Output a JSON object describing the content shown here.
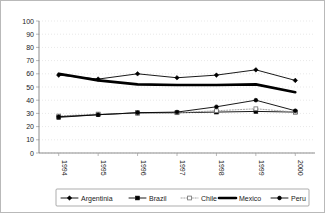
{
  "chart_data": {
    "type": "line",
    "title": "",
    "subtitle": "",
    "xlabel": "",
    "ylabel": "",
    "categories": [
      "1994",
      "1995",
      "1996",
      "1997",
      "1998",
      "1999",
      "2000"
    ],
    "ylim": [
      0,
      100
    ],
    "yticks": [
      0,
      10,
      20,
      30,
      40,
      50,
      60,
      70,
      80,
      90,
      100
    ],
    "grid": true,
    "legend_position": "bottom",
    "series": [
      {
        "name": "Argentinia",
        "values": [
          59,
          56,
          60,
          57,
          59,
          63,
          55
        ],
        "color": "#000000",
        "marker": "diamond",
        "line_style": "solid",
        "line_width": 0.9
      },
      {
        "name": "Brazil",
        "values": [
          27,
          29,
          30.5,
          30.5,
          31,
          31.5,
          31
        ],
        "color": "#000000",
        "marker": "square",
        "line_style": "solid",
        "line_width": 0.9
      },
      {
        "name": "Chile",
        "values": [
          28,
          29.5,
          30,
          30.5,
          32,
          33.5,
          31
        ],
        "color": "#9a9a9a",
        "marker": "open-square",
        "line_style": "dotted",
        "line_width": 0.9
      },
      {
        "name": "Mexico",
        "values": [
          60,
          55,
          52,
          51.5,
          51.5,
          52,
          46
        ],
        "color": "#000000",
        "marker": "none",
        "line_style": "solid",
        "line_width": 2.6
      },
      {
        "name": "Peru",
        "values": [
          27.5,
          29,
          30.5,
          31,
          35,
          40,
          32
        ],
        "color": "#000000",
        "marker": "circle",
        "line_style": "solid",
        "line_width": 0.9
      }
    ]
  },
  "axes": {
    "ytick_labels": [
      "100",
      "90",
      "80",
      "70",
      "60",
      "50",
      "40",
      "30",
      "20",
      "10",
      "0"
    ],
    "xtick_labels": [
      "1994",
      "1995",
      "1996",
      "1997",
      "1998",
      "1999",
      "2000"
    ]
  },
  "legend": {
    "items": [
      {
        "label": "Argentinia",
        "icon": "diamond-marker-line-icon"
      },
      {
        "label": "Brazil",
        "icon": "square-marker-line-icon"
      },
      {
        "label": "Chile",
        "icon": "dotted-line-icon"
      },
      {
        "label": "Mexico",
        "icon": "thick-line-icon"
      },
      {
        "label": "Peru",
        "icon": "circle-marker-line-icon"
      }
    ]
  }
}
